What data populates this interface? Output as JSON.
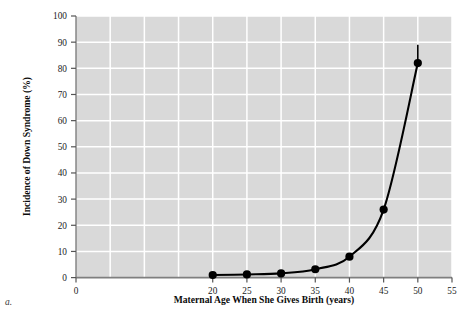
{
  "figure": {
    "panel_label": "a.",
    "background_color": "#ffffff",
    "plot_background_color": "#d9d9d9",
    "gridline_color": "#ffffff",
    "curve_color": "#000000",
    "marker_color": "#000000",
    "axis_color": "#808080"
  },
  "chart_data": {
    "type": "line",
    "title": "",
    "xlabel": "Maternal Age When She Gives Birth (years)",
    "ylabel": "Incidence of Down Syndrome (%)",
    "xlim": [
      0,
      55
    ],
    "ylim": [
      0,
      100
    ],
    "xticks": [
      0,
      5,
      10,
      15,
      20,
      25,
      30,
      35,
      40,
      45,
      50,
      55
    ],
    "xtick_labels": [
      "0",
      "",
      "",
      "",
      "20",
      "25",
      "30",
      "35",
      "40",
      "45",
      "50",
      "55"
    ],
    "yticks": [
      0,
      10,
      20,
      30,
      40,
      50,
      60,
      70,
      80,
      90,
      100
    ],
    "ytick_labels": [
      "0",
      "10",
      "20",
      "30",
      "40",
      "50",
      "60",
      "70",
      "80",
      "90",
      "100"
    ],
    "grid": true,
    "grid_axis": "both",
    "legend": false,
    "x": [
      20,
      25,
      30,
      35,
      40,
      45,
      50
    ],
    "y": [
      1,
      1.2,
      1.6,
      3.2,
      8,
      26,
      82
    ],
    "markers": "filled-circle",
    "annotations": [
      {
        "label": "error-bar-at-50",
        "x": 50,
        "y_low": 82,
        "y_high": 89
      }
    ]
  },
  "axis_labels": {
    "x_title": "Maternal Age When She Gives Birth (years)",
    "y_title": "Incidence of Down Syndrome (%)"
  }
}
